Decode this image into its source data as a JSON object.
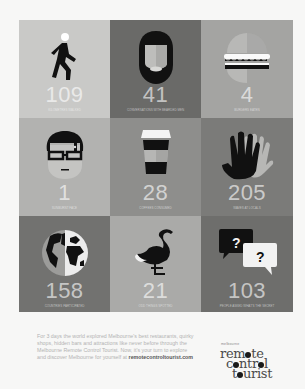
{
  "colors": {
    "page_background": "#f7f7f6",
    "tile_light": "#c5c5c3",
    "tile_mid": "#9a9a98",
    "tile_dark": "#6d6d6b",
    "number_color": "#ffffff"
  },
  "tiles": [
    {
      "icon": "walking-person-icon",
      "number": "109",
      "caption": "kilometres walked",
      "bg": "#c9c9c7"
    },
    {
      "icon": "bearded-face-icon",
      "number": "41",
      "caption": "conversations with bearded men",
      "bg": "#6a6a68"
    },
    {
      "icon": "burger-icon",
      "number": "4",
      "caption": "burgers eaten",
      "bg": "#a4a4a2"
    },
    {
      "icon": "face-with-glasses-icon",
      "number": "1",
      "caption": "sunburnt face",
      "bg": "#b2b2b0"
    },
    {
      "icon": "coffee-cup-icon",
      "number": "28",
      "caption": "coffees consumed",
      "bg": "#8e8e8c"
    },
    {
      "icon": "waving-hands-icon",
      "number": "205",
      "caption": "waves at locals",
      "bg": "#7b7b79"
    },
    {
      "icon": "globe-icon",
      "number": "158",
      "caption": "countries participated",
      "bg": "#727270"
    },
    {
      "icon": "flamingo-icon",
      "number": "21",
      "caption": "odd things spotted",
      "bg": "#aaaaa8"
    },
    {
      "icon": "question-bubbles-icon",
      "number": "103",
      "caption": "people asked what's the secret",
      "bg": "#6e6e6c"
    }
  ],
  "footer": {
    "text": "For 3 days the world explored Melbourne's best restaurants, quirky shops, hidden bars and attractions like never before through the Melbourne Remote Control Tourist. Now, it's your turn to explore and discover Melbourne for yourself at",
    "link": "remotecontroltourist.com"
  },
  "logo": {
    "small": "melbourne",
    "line1_a": "rem",
    "line1_b": "te",
    "line2_a": "c",
    "line2_b": "ntr",
    "line2_c": "l",
    "line3_a": "t",
    "line3_b": "urist"
  }
}
